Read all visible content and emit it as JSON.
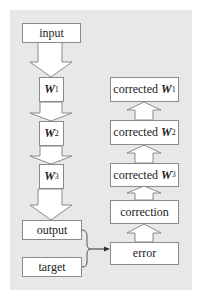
{
  "diagram": {
    "forward": {
      "input": "input",
      "layers": [
        {
          "name": "W",
          "sup": "1"
        },
        {
          "name": "W",
          "sup": "2"
        },
        {
          "name": "W",
          "sup": "3"
        }
      ],
      "output": "output",
      "target": "target"
    },
    "backward": {
      "corrected": [
        {
          "prefix": "corrected ",
          "name": "W",
          "sup": "1"
        },
        {
          "prefix": "corrected ",
          "name": "W",
          "sup": "2"
        },
        {
          "prefix": "corrected ",
          "name": "W",
          "sup": "3"
        }
      ],
      "correction": "correction",
      "error": "error"
    },
    "colors": {
      "panel": "#e8e8e8",
      "box_fill": "#ffffff",
      "stroke": "#8a8a8a",
      "connector": "#333333"
    }
  }
}
